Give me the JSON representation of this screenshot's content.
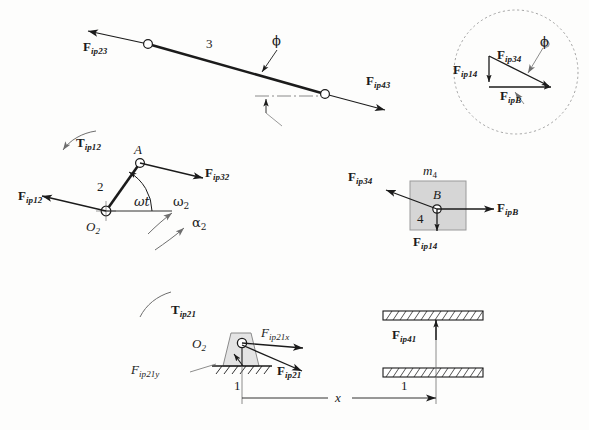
{
  "figure": {
    "background_color": "#fdfdfc",
    "line_color": "#1b1b1b",
    "block_fill": "#d6d6d6"
  },
  "link3": {
    "link_number": "3",
    "force_left": {
      "symbol": "F",
      "subscript": "ip23"
    },
    "force_right": {
      "symbol": "F",
      "subscript": "ip43"
    },
    "angle_label": "ϕ"
  },
  "inset": {
    "force_vertical": {
      "symbol": "F",
      "subscript": "ip14"
    },
    "force_upper": {
      "symbol": "F",
      "subscript": "ip34"
    },
    "force_lower": {
      "symbol": "F",
      "subscript": "ipB"
    },
    "angle_label": "ϕ"
  },
  "crank": {
    "link_number": "2",
    "joint_label": "A",
    "pivot_label": "O",
    "pivot_subscript": "2",
    "torque": {
      "symbol": "T",
      "subscript": "ip12"
    },
    "force_pivot": {
      "symbol": "F",
      "subscript": "ip12"
    },
    "force_joint": {
      "symbol": "F",
      "subscript": "ip32"
    },
    "angle_label": "ωt",
    "omega_label": "ω",
    "omega_subscript": "2",
    "alpha_label": "α",
    "alpha_subscript": "2"
  },
  "slider": {
    "mass_label": "m",
    "mass_subscript": "4",
    "center_label": "B",
    "link_number": "4",
    "force_left": {
      "symbol": "F",
      "subscript": "ip34"
    },
    "force_right": {
      "symbol": "F",
      "subscript": "ipB"
    },
    "force_down": {
      "symbol": "F",
      "subscript": "ip14"
    }
  },
  "ground_left": {
    "pivot_label": "O",
    "pivot_subscript": "2",
    "link_number": "1",
    "torque": {
      "symbol": "T",
      "subscript": "ip21"
    },
    "force_x": {
      "symbol": "F",
      "subscript": "ip21x"
    },
    "force_y": {
      "symbol": "F",
      "subscript": "ip21y"
    },
    "force_resultant": {
      "symbol": "F",
      "subscript": "ip21"
    }
  },
  "ground_right": {
    "link_number": "1",
    "force_up": {
      "symbol": "F",
      "subscript": "ip41"
    }
  },
  "dimension": {
    "label": "x"
  }
}
